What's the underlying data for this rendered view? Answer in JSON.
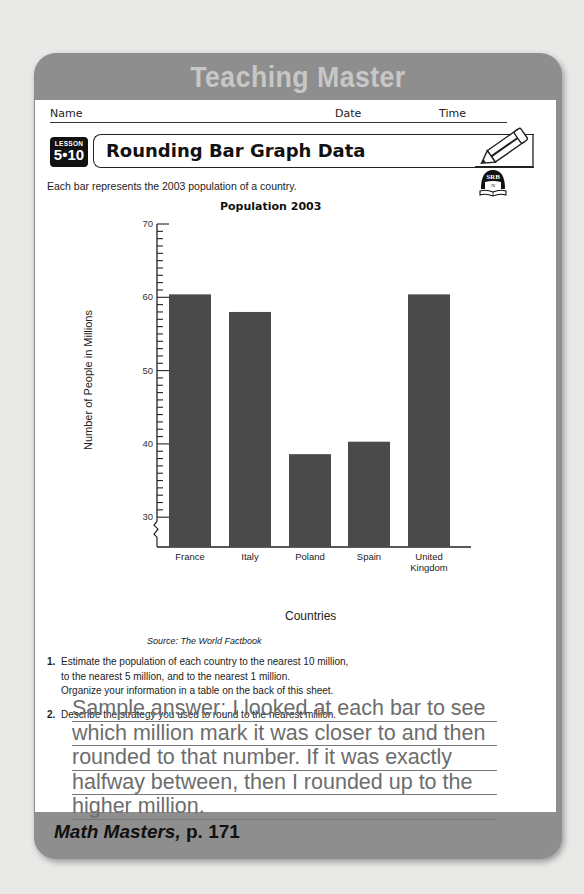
{
  "header_banner": {
    "title": "Teaching Master"
  },
  "student_fields": {
    "name_label": "Name",
    "date_label": "Date",
    "time_label": "Time"
  },
  "lesson": {
    "badge_label": "LESSON",
    "badge_number": "5•10",
    "title": "Rounding Bar Graph Data"
  },
  "icons": {
    "pencil": "pencil-icon",
    "srb": "srb-book-icon",
    "srb_text": "SRB",
    "srb_page": "76"
  },
  "intro_text": "Each bar represents the 2003 population of a country.",
  "chart_data": {
    "type": "bar",
    "title": "Population 2003",
    "xlabel": "Countries",
    "ylabel": "Number of People in Millions",
    "categories": [
      "France",
      "Italy",
      "Poland",
      "Spain",
      "United Kingdom"
    ],
    "category_labels": [
      [
        "France"
      ],
      [
        "Italy"
      ],
      [
        "Poland"
      ],
      [
        "Spain"
      ],
      [
        "United",
        "Kingdom"
      ]
    ],
    "values": [
      60.4,
      58.0,
      38.6,
      40.3,
      60.4
    ],
    "ylim": [
      30,
      70
    ],
    "y_axis_break": true,
    "yticks": [
      30,
      40,
      50,
      60,
      70
    ],
    "minor_tick_step": 1,
    "grid": false,
    "bar_color": "#4a4a4a",
    "source": "Source: The World Factbook"
  },
  "questions": [
    {
      "number": "1.",
      "lines": [
        "Estimate the population of each country to the nearest 10 million,",
        "to the nearest 5 million, and to the nearest 1 million.",
        "Organize your information in a table on the back of this sheet."
      ]
    },
    {
      "number": "2.",
      "lines": [
        "Describe the strategy you used to round to the nearest million."
      ]
    }
  ],
  "answer_lines": [
    "Sample answer: I looked at each bar to see",
    "which million mark it was closer to and then",
    "rounded to that number. If it was exactly",
    "halfway between, then I rounded up to the",
    "higher million."
  ],
  "footer": {
    "book": "Math Masters,",
    "page": " p. 171"
  },
  "colors": {
    "frame": "#8e8e8e",
    "banner_text": "#c7c7c7",
    "answer_text": "#6d6d6d",
    "background": "#e9e9e7"
  }
}
